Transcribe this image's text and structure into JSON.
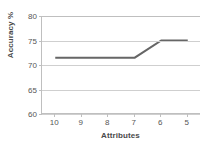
{
  "chart_data": {
    "type": "line",
    "title": "",
    "xlabel": "Attributes",
    "ylabel": "Accuracy %",
    "categories": [
      "10",
      "9",
      "8",
      "7",
      "6",
      "5"
    ],
    "x": [
      10,
      9,
      8,
      7,
      6,
      5
    ],
    "values": [
      71.5,
      71.5,
      71.5,
      71.5,
      75,
      75
    ],
    "series": [
      {
        "name": "Accuracy",
        "values": [
          71.5,
          71.5,
          71.5,
          71.5,
          75,
          75
        ],
        "color": "#666666"
      }
    ],
    "ylim": [
      60,
      80
    ],
    "yticks": [
      60,
      65,
      70,
      75,
      80
    ],
    "ytick_labels": [
      "60",
      "65",
      "70",
      "75",
      "80"
    ],
    "xtick_labels": [
      "10",
      "9",
      "8",
      "7",
      "6",
      "5"
    ],
    "grid": "horizontal",
    "legend": "none",
    "markers": "none",
    "x_axis_direction": "descending"
  },
  "style": {
    "line_color": "#666666",
    "grid_color": "#cfcfcf",
    "axis_color": "#bfbfbf",
    "tick_text_color": "#555555",
    "axis_title_color": "#4a4a4a",
    "background": "#ffffff"
  }
}
